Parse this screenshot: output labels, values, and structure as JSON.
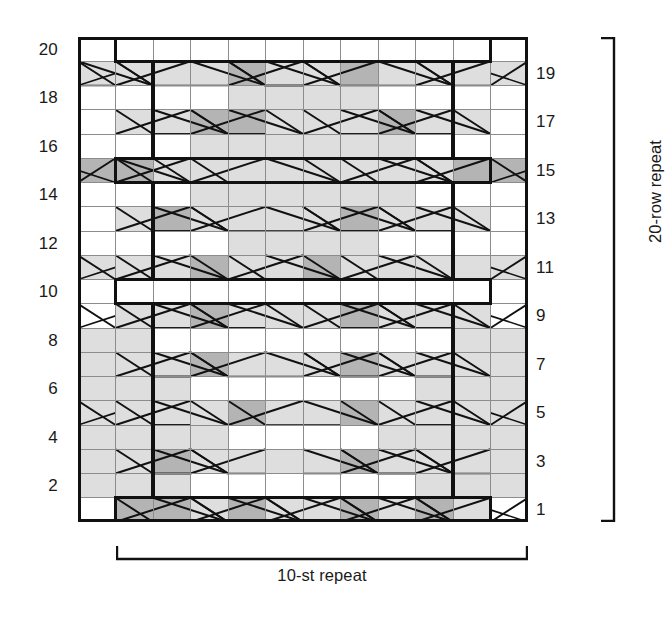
{
  "axis": {
    "left_row_numbers": [
      "20",
      "18",
      "16",
      "14",
      "12",
      "10",
      "8",
      "6",
      "4",
      "2"
    ],
    "right_row_numbers": [
      "19",
      "17",
      "15",
      "13",
      "11",
      "9",
      "7",
      "5",
      "3",
      "1"
    ]
  },
  "captions": {
    "stitch_repeat": "10-st repeat",
    "row_repeat": "20-row repeat"
  },
  "colors": {
    "background": "#ffffff",
    "grid_line": "#8c8c8c",
    "bold_line": "#111111",
    "symbol_line": "#111111",
    "cell_white": "#ffffff",
    "cell_light_gray": "#dedede",
    "cell_mid_gray": "#b4b4b4"
  },
  "chart_data": {
    "type": "heatmap",
    "columns": 12,
    "rows": 20,
    "xlabel": "stitches",
    "ylabel": "rows",
    "grid": true,
    "legend_position": "none",
    "repeat_box": {
      "col_start": 2,
      "col_end": 11,
      "row_start": 1,
      "row_end": 20
    },
    "cell_fills": [
      [
        "W",
        "W",
        "W",
        "W",
        "W",
        "W",
        "W",
        "W",
        "W",
        "W",
        "W",
        "W"
      ],
      [
        "L",
        "L",
        "L",
        "L",
        "M",
        "L",
        "L",
        "M",
        "L",
        "L",
        "L",
        "L"
      ],
      [
        "W",
        "W",
        "W",
        "W",
        "L",
        "L",
        "L",
        "L",
        "W",
        "W",
        "W",
        "W"
      ],
      [
        "W",
        "L",
        "L",
        "M",
        "M",
        "L",
        "L",
        "L",
        "M",
        "L",
        "L",
        "W"
      ],
      [
        "W",
        "W",
        "W",
        "L",
        "L",
        "L",
        "L",
        "L",
        "L",
        "W",
        "W",
        "W"
      ],
      [
        "M",
        "M",
        "L",
        "L",
        "L",
        "L",
        "L",
        "L",
        "L",
        "L",
        "M",
        "M"
      ],
      [
        "W",
        "W",
        "W",
        "L",
        "L",
        "L",
        "L",
        "L",
        "L",
        "W",
        "W",
        "W"
      ],
      [
        "W",
        "L",
        "M",
        "L",
        "L",
        "L",
        "L",
        "M",
        "L",
        "L",
        "L",
        "W"
      ],
      [
        "W",
        "W",
        "W",
        "W",
        "L",
        "L",
        "L",
        "L",
        "W",
        "W",
        "W",
        "W"
      ],
      [
        "L",
        "L",
        "L",
        "M",
        "L",
        "L",
        "M",
        "L",
        "L",
        "L",
        "L",
        "L"
      ],
      [
        "W",
        "W",
        "W",
        "W",
        "W",
        "W",
        "W",
        "W",
        "W",
        "W",
        "W",
        "W"
      ],
      [
        "W",
        "L",
        "L",
        "M",
        "L",
        "L",
        "L",
        "M",
        "L",
        "L",
        "L",
        "W"
      ],
      [
        "L",
        "L",
        "W",
        "W",
        "W",
        "W",
        "W",
        "W",
        "W",
        "W",
        "L",
        "L"
      ],
      [
        "L",
        "L",
        "L",
        "M",
        "L",
        "L",
        "L",
        "M",
        "L",
        "L",
        "L",
        "L"
      ],
      [
        "L",
        "L",
        "L",
        "W",
        "W",
        "W",
        "W",
        "W",
        "W",
        "L",
        "L",
        "L"
      ],
      [
        "L",
        "L",
        "L",
        "L",
        "M",
        "L",
        "L",
        "M",
        "L",
        "L",
        "L",
        "L"
      ],
      [
        "L",
        "L",
        "L",
        "L",
        "W",
        "W",
        "W",
        "W",
        "L",
        "L",
        "L",
        "L"
      ],
      [
        "L",
        "L",
        "M",
        "L",
        "L",
        "L",
        "L",
        "M",
        "L",
        "L",
        "L",
        "L"
      ],
      [
        "L",
        "L",
        "L",
        "W",
        "W",
        "W",
        "W",
        "W",
        "W",
        "L",
        "L",
        "L"
      ],
      [
        "W",
        "M",
        "M",
        "L",
        "M",
        "L",
        "L",
        "M",
        "L",
        "M",
        "L",
        "W"
      ]
    ],
    "cable_rows": [
      2,
      4,
      6,
      8,
      10,
      12,
      14,
      16,
      18,
      20
    ]
  },
  "icons": {
    "bracket_horizontal": "bracket-horizontal-icon",
    "bracket_vertical": "bracket-vertical-icon"
  }
}
